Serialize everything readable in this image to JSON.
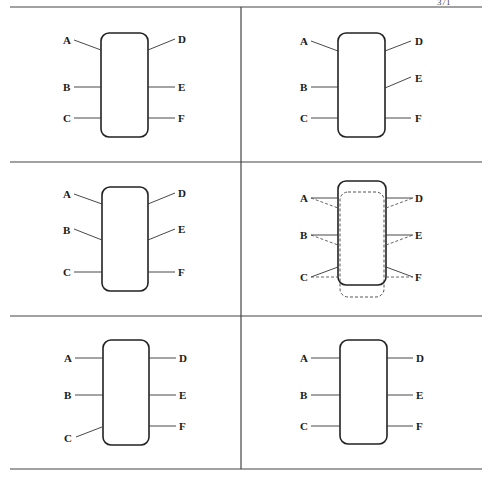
{
  "header": {
    "page_mark": "371"
  },
  "layout": {
    "rows": 3,
    "columns": 2
  },
  "pin_labels": {
    "left": [
      "A",
      "B",
      "C"
    ],
    "right": [
      "D",
      "E",
      "F"
    ]
  },
  "panels": [
    {
      "id": "top-left",
      "description": "A and D leads angled upward; B, C, E, F straight",
      "labels": {
        "A": "A",
        "B": "B",
        "C": "C",
        "D": "D",
        "E": "E",
        "F": "F"
      }
    },
    {
      "id": "top-right",
      "description": "A, D, E leads angled; B, C, F straight",
      "labels": {
        "A": "A",
        "B": "B",
        "C": "C",
        "D": "D",
        "E": "E",
        "F": "F"
      }
    },
    {
      "id": "middle-left",
      "description": "A, B, D, E leads angled; C, F straight",
      "labels": {
        "A": "A",
        "B": "B",
        "C": "C",
        "D": "D",
        "E": "E",
        "F": "F"
      }
    },
    {
      "id": "middle-right",
      "description": "Body displaced: solid outline shifted up, dashed outline original position; solid and dashed leads",
      "labels": {
        "A": "A",
        "B": "B",
        "C": "C",
        "D": "D",
        "E": "E",
        "F": "F"
      }
    },
    {
      "id": "bottom-left",
      "description": "C lead angled downward; others straight",
      "labels": {
        "A": "A",
        "B": "B",
        "C": "C",
        "D": "D",
        "E": "E",
        "F": "F"
      }
    },
    {
      "id": "bottom-right",
      "description": "All leads straight (normal)",
      "labels": {
        "A": "A",
        "B": "B",
        "C": "C",
        "D": "D",
        "E": "E",
        "F": "F"
      }
    }
  ]
}
